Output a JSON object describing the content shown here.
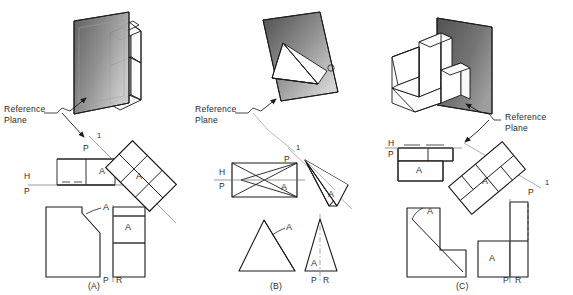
{
  "figure": {
    "panels": [
      {
        "id": "A",
        "caption": "(A)",
        "reference_plane_label": "Reference\nPlane",
        "fold_line_aux": {
          "near": "P",
          "far": "1"
        },
        "fold_line_hp": {
          "upper": "H",
          "lower": "P"
        },
        "fold_line_pr": {
          "left": "P",
          "right": "R"
        },
        "surface_labels": [
          "A",
          "A",
          "A",
          "A"
        ],
        "object": "notched block with chamfered corner",
        "views": [
          "pictorial",
          "top",
          "auxiliary",
          "front",
          "right-side"
        ]
      },
      {
        "id": "B",
        "caption": "(B)",
        "reference_plane_label": "Reference\nPlane",
        "fold_line_aux": {
          "near": "P",
          "far": "1"
        },
        "fold_line_hp": {
          "upper": "H",
          "lower": "P"
        },
        "fold_line_pr": {
          "left": "P",
          "right": "R"
        },
        "surface_labels": [
          "A",
          "A",
          "A",
          "A"
        ],
        "object": "oblique pyramid",
        "views": [
          "pictorial",
          "top",
          "auxiliary",
          "front",
          "right-side"
        ]
      },
      {
        "id": "C",
        "caption": "(C)",
        "reference_plane_label": "Reference\nPlane",
        "fold_line_aux": {
          "near": "P",
          "far": "1"
        },
        "fold_line_hp": {
          "upper": "H",
          "lower": "P"
        },
        "fold_line_pr": {
          "left": "P",
          "right": "R"
        },
        "surface_labels": [
          "A",
          "A",
          "A",
          "A"
        ],
        "object": "L-shaped block with inclined face",
        "views": [
          "pictorial",
          "top",
          "auxiliary",
          "front",
          "right-side"
        ]
      }
    ],
    "colors": {
      "line": "#1a1a1a",
      "plane_dark": "#4a4a4a",
      "plane_light": "#d8d8d8",
      "phantom": "#8a8a8a",
      "text": "#2a2a2a"
    }
  }
}
